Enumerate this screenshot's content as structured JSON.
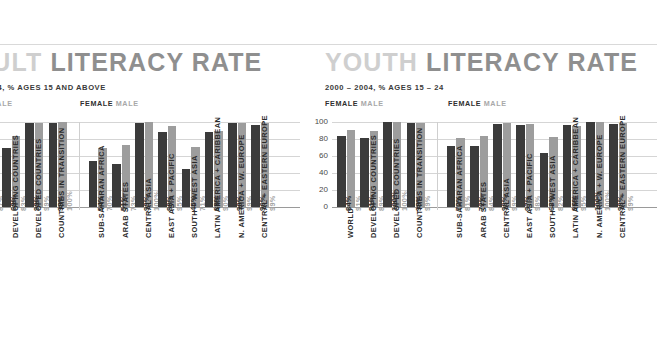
{
  "top_rule": true,
  "panels": [
    {
      "id": "adult",
      "title_word1": "ADULT",
      "title_word2": "LITERACY RATE",
      "subtitle": "2000 – 2004, % AGES 15 AND ABOVE",
      "legend_left": {
        "female": "FEMALE",
        "male": "MALE"
      },
      "legend_right": {
        "female": "FEMALE",
        "male": "MALE"
      },
      "clipped_left": true
    },
    {
      "id": "youth",
      "title_word1": "YOUTH",
      "title_word2": "LITERACY RATE",
      "subtitle": "2000 – 2004, % AGES 15 – 24",
      "legend_left": {
        "female": "FEMALE",
        "male": "MALE"
      },
      "legend_right": {
        "female": "FEMALE",
        "male": "MALE"
      },
      "clipped_left": false
    }
  ],
  "axis": {
    "ticks": [
      "0",
      "20",
      "40",
      "60",
      "80",
      "100"
    ],
    "min": 0,
    "max": 100
  },
  "colors": {
    "female_bar": "#3b3b3b",
    "male_bar": "#9d9d9d",
    "title_light": "#cfcfcf",
    "title_dark": "#8f8f8f",
    "gridline": "#d5d5d5",
    "baseline": "#9a9a9a"
  },
  "chart_data": [
    {
      "type": "bar",
      "title": "ADULT LITERACY RATE",
      "subtitle": "2000 – 2004, % AGES 15 AND ABOVE",
      "xlabel": "",
      "ylabel": "",
      "ylim": [
        0,
        100
      ],
      "yticks": [
        0,
        20,
        40,
        60,
        80,
        100
      ],
      "grid": true,
      "legend": [
        "FEMALE",
        "MALE"
      ],
      "legend_position": "top-left",
      "categories": [
        "WORLD",
        "DEVELOPING COUNTRIES",
        "DEVELOPED COUNTRIES",
        "COUNTRIES IN TRANSITION",
        "SUB-SAHARAN AFRICA",
        "ARAB STATES",
        "CENTRAL ASIA",
        "EAST ASIA + PACIFIC",
        "SOUTH + WEST ASIA",
        "LATIN AMERICA + CARIBBEAN",
        "N. AMERICA + W. EUROPE",
        "CENTRAL + EASTERN EUROPE"
      ],
      "series": [
        {
          "name": "FEMALE",
          "values": [
            77,
            69,
            99,
            99,
            54,
            51,
            99,
            88,
            45,
            88,
            99,
            96
          ]
        },
        {
          "name": "MALE",
          "values": [
            87,
            83,
            99,
            100,
            70,
            73,
            100,
            95,
            71,
            90,
            99,
            99
          ]
        }
      ],
      "value_labels": {
        "female": [
          "77%",
          "69%",
          "99%",
          "99%",
          "54%",
          "51%",
          "99%",
          "88%",
          "45%",
          "88%",
          "99%",
          "96%"
        ],
        "male": [
          "87%",
          "83%",
          "99%",
          "100%",
          "70%",
          "73%",
          "100%",
          "95%",
          "71%",
          "90%",
          "99%",
          "99%"
        ]
      }
    },
    {
      "type": "bar",
      "title": "YOUTH LITERACY RATE",
      "subtitle": "2000 – 2004, % AGES 15 – 24",
      "xlabel": "",
      "ylabel": "",
      "ylim": [
        0,
        100
      ],
      "yticks": [
        0,
        20,
        40,
        60,
        80,
        100
      ],
      "grid": true,
      "legend": [
        "FEMALE",
        "MALE"
      ],
      "legend_position": "top-left",
      "categories": [
        "WORLD",
        "DEVELOPING COUNTRIES",
        "DEVELOPED COUNTRIES",
        "COUNTRIES IN TRANSITION",
        "SUB-SAHARAN AFRICA",
        "ARAB STATES",
        "CENTRAL ASIA",
        "EAST ASIA + PACIFIC",
        "SOUTH + WEST ASIA",
        "LATIN AMERICA + CARIBBEAN",
        "N. AMERICA + W. EUROPE",
        "CENTRAL + EASTERN EUROPE"
      ],
      "series": [
        {
          "name": "FEMALE",
          "values": [
            84,
            81,
            100,
            99,
            72,
            72,
            98,
            97,
            63,
            96,
            100,
            98
          ]
        },
        {
          "name": "MALE",
          "values": [
            91,
            89,
            100,
            99,
            81,
            84,
            99,
            98,
            82,
            95,
            100,
            99
          ]
        }
      ],
      "value_labels": {
        "female": [
          "84%",
          "81%",
          "100%",
          "99%",
          "72%",
          "72%",
          "98%",
          "97%",
          "63%",
          "96%",
          "100%",
          "98%"
        ],
        "male": [
          "91%",
          "89%",
          "100%",
          "99%",
          "81%",
          "84%",
          "99%",
          "98%",
          "82%",
          "95%",
          "100%",
          "99%"
        ]
      }
    }
  ]
}
